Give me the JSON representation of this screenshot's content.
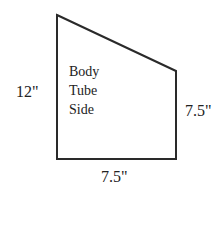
{
  "diagram": {
    "shape": "trapezoid",
    "stroke_color": "#2a2a2a",
    "inner_label": [
      "Body",
      "Tube",
      "Side"
    ],
    "dimensions": {
      "left_height": "12\"",
      "right_height": "7.5\"",
      "bottom_width": "7.5\""
    }
  }
}
